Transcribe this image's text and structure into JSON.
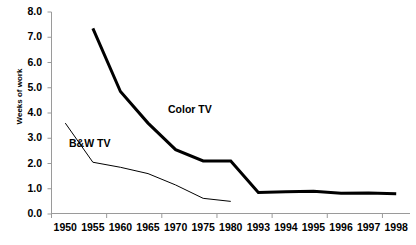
{
  "chart_data": {
    "type": "line",
    "title": "",
    "subtitle": "",
    "xlabel": "",
    "ylabel": "Weeks of work",
    "categories": [
      "1950",
      "1955",
      "1960",
      "1965",
      "1970",
      "1975",
      "1980",
      "1993",
      "1994",
      "1995",
      "1996",
      "1997",
      "1998"
    ],
    "ylim": [
      0.0,
      8.0
    ],
    "ytick_labels": [
      "0.0",
      "1.0",
      "2.0",
      "3.0",
      "4.0",
      "5.0",
      "6.0",
      "7.0",
      "8.0"
    ],
    "ytick_values": [
      0.0,
      1.0,
      2.0,
      3.0,
      4.0,
      5.0,
      6.0,
      7.0,
      8.0
    ],
    "grid": false,
    "legend_position": "inline-annotation",
    "series": [
      {
        "name": "Color TV",
        "color": "#000000",
        "line_width": 3.0,
        "x": [
          "1955",
          "1960",
          "1965",
          "1970",
          "1975",
          "1980",
          "1993",
          "1994",
          "1995",
          "1996",
          "1997",
          "1998"
        ],
        "values": [
          7.35,
          4.85,
          3.6,
          2.55,
          2.1,
          2.1,
          0.85,
          0.88,
          0.9,
          0.82,
          0.83,
          0.8
        ]
      },
      {
        "name": "B&W TV",
        "color": "#000000",
        "line_width": 1.0,
        "x": [
          "1950",
          "1955",
          "1960",
          "1965",
          "1970",
          "1975",
          "1980"
        ],
        "values": [
          3.6,
          2.05,
          1.85,
          1.6,
          1.15,
          0.62,
          0.5
        ]
      }
    ],
    "annotations": [
      {
        "text": "Color TV",
        "x_px": 168,
        "y_px": 103
      },
      {
        "text": "B&W TV",
        "x_px": 69,
        "y_px": 137
      }
    ]
  },
  "axes": {
    "y_axis_name": "y-axis",
    "x_axis_name": "x-axis"
  }
}
